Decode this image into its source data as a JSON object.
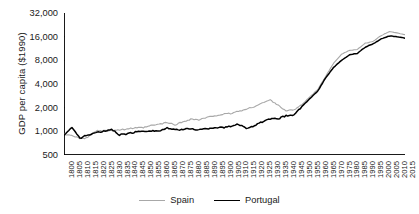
{
  "chart_data": {
    "type": "line",
    "title": "",
    "xlabel": "",
    "ylabel": "GDP per capita ($1990)",
    "yscale": "log",
    "ylim": [
      500,
      32000
    ],
    "xlim": [
      1800,
      2015
    ],
    "grid": false,
    "legend_position": "bottom-center",
    "ytick_labels": [
      "32,000",
      "16,000",
      "8,000",
      "4,000",
      "2,000",
      "1,000",
      "500"
    ],
    "ytick_values": [
      32000,
      16000,
      8000,
      4000,
      2000,
      1000,
      500
    ],
    "xtick_labels": [
      "1800",
      "1805",
      "1810",
      "1815",
      "1820",
      "1825",
      "1830",
      "1835",
      "1840",
      "1845",
      "1850",
      "1855",
      "1860",
      "1865",
      "1870",
      "1875",
      "1880",
      "1885",
      "1890",
      "1895",
      "1900",
      "1905",
      "1910",
      "1915",
      "1920",
      "1925",
      "1930",
      "1935",
      "1940",
      "1945",
      "1950",
      "1955",
      "1960",
      "1965",
      "1970",
      "1975",
      "1980",
      "1985",
      "1990",
      "1995",
      "2000",
      "2005",
      "2010",
      "2015"
    ],
    "x": [
      1800,
      1805,
      1810,
      1815,
      1820,
      1825,
      1830,
      1835,
      1840,
      1845,
      1850,
      1855,
      1860,
      1865,
      1870,
      1875,
      1880,
      1885,
      1890,
      1895,
      1900,
      1905,
      1910,
      1915,
      1920,
      1925,
      1930,
      1935,
      1940,
      1945,
      1950,
      1955,
      1960,
      1965,
      1970,
      1975,
      1980,
      1985,
      1990,
      1995,
      2000,
      2005,
      2010,
      2015
    ],
    "series": [
      {
        "name": "Spain",
        "color": "#a8a8a8",
        "values": [
          910,
          900,
          800,
          830,
          1010,
          1020,
          1030,
          1040,
          1080,
          1100,
          1110,
          1180,
          1230,
          1290,
          1210,
          1320,
          1430,
          1400,
          1490,
          1580,
          1640,
          1680,
          1800,
          1900,
          2070,
          2290,
          2500,
          2170,
          1800,
          1900,
          2180,
          2750,
          3400,
          5000,
          7350,
          9600,
          10700,
          11000,
          13200,
          14000,
          16500,
          18600,
          17800,
          17000
        ],
        "linewidth": 1.1
      },
      {
        "name": "Portugal",
        "color": "#000000",
        "values": [
          900,
          1120,
          820,
          900,
          960,
          1000,
          1060,
          900,
          930,
          980,
          1010,
          1020,
          1010,
          1100,
          1040,
          1060,
          1080,
          1050,
          1080,
          1120,
          1110,
          1160,
          1230,
          1100,
          1180,
          1320,
          1430,
          1450,
          1580,
          1620,
          2070,
          2600,
          3250,
          4800,
          6500,
          8000,
          9400,
          9800,
          11800,
          13000,
          15000,
          16300,
          16000,
          15300
        ],
        "linewidth": 1.5
      }
    ]
  },
  "legend": {
    "items": [
      {
        "label": "Spain",
        "color": "#a8a8a8"
      },
      {
        "label": "Portugal",
        "color": "#000000"
      }
    ]
  },
  "axes": {
    "y_title": "GDP per capita ($1990)",
    "axis_color": "#000000"
  }
}
